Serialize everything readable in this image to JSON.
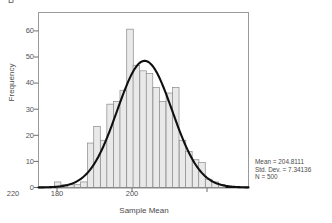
{
  "panel": {
    "tag": "B"
  },
  "axes": {
    "ylabel": "Frequency",
    "xlabel": "Sample Mean",
    "yticks": [
      "0",
      "10",
      "20",
      "30",
      "40",
      "50",
      "60"
    ],
    "xticks": [
      "180",
      "200",
      "220"
    ]
  },
  "stats": {
    "mean_line": "Mean = 204.8111",
    "sd_line": "Std. Dev. = 7.34136",
    "n_line": "N = 500"
  },
  "colors": {
    "bar_fill": "#e9e9e9",
    "bar_stroke": "#8a8a8a",
    "curve": "#101010",
    "frame": "#9a9a9a",
    "text": "#4b4b4b",
    "background": "#ffffff"
  },
  "chart_data": {
    "type": "bar",
    "title": "",
    "subtitle": "",
    "xlabel": "Sample Mean",
    "ylabel": "Frequency",
    "xlim": [
      176.5,
      232.5
    ],
    "ylim": [
      0,
      63
    ],
    "grid": false,
    "legend": false,
    "bin_width": 1.75,
    "categories": [
      "181.6",
      "183.4",
      "185.1",
      "186.9",
      "188.6",
      "190.4",
      "192.1",
      "193.9",
      "195.6",
      "197.4",
      "199.1",
      "200.9",
      "202.6",
      "204.4",
      "206.1",
      "207.9",
      "209.6",
      "211.4",
      "213.1",
      "214.9",
      "216.6",
      "218.4",
      "220.1",
      "221.9",
      "223.6",
      "225.4"
    ],
    "values": [
      2,
      1,
      1,
      1,
      2,
      16,
      22,
      17,
      30,
      31,
      35,
      57,
      44,
      42,
      41,
      36,
      31,
      34,
      36,
      17,
      13,
      10,
      9,
      3,
      2,
      1
    ],
    "overlay": {
      "type": "line",
      "name": "Normal curve",
      "mean": 204.8111,
      "std_dev": 7.34136,
      "n": 500,
      "peak_value": 45.6,
      "annotations": [
        "Mean = 204.8111",
        "Std. Dev. = 7.34136",
        "N = 500"
      ]
    }
  }
}
